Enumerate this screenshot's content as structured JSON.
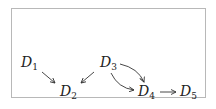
{
  "diagram": {
    "type": "directed-graph",
    "nodes": [
      {
        "id": "D1",
        "base": "D",
        "sub": "1"
      },
      {
        "id": "D2",
        "base": "D",
        "sub": "2"
      },
      {
        "id": "D3",
        "base": "D",
        "sub": "3"
      },
      {
        "id": "D4",
        "base": "D",
        "sub": "4"
      },
      {
        "id": "D5",
        "base": "D",
        "sub": "5"
      }
    ],
    "edges": [
      {
        "from": "D1",
        "to": "D2",
        "style": "straight"
      },
      {
        "from": "D3",
        "to": "D2",
        "style": "straight"
      },
      {
        "from": "D3",
        "to": "D4",
        "style": "curved-upper"
      },
      {
        "from": "D3",
        "to": "D4",
        "style": "curved-lower"
      },
      {
        "from": "D4",
        "to": "D5",
        "style": "straight"
      }
    ]
  }
}
